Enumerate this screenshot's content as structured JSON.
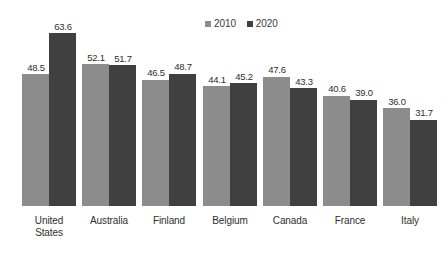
{
  "chart_data": {
    "type": "bar",
    "title": "",
    "subtitle": "",
    "xlabel": "",
    "ylabel": "",
    "ylim": [
      0,
      63.6
    ],
    "grid": false,
    "legend_position": "top-center-right",
    "categories": [
      "United States",
      "Australia",
      "Finland",
      "Belgium",
      "Canada",
      "France",
      "Italy"
    ],
    "category_lines": [
      [
        "United",
        "States"
      ],
      [
        "Australia"
      ],
      [
        "Finland"
      ],
      [
        "Belgium"
      ],
      [
        "Canada"
      ],
      [
        "France"
      ],
      [
        "Italy"
      ]
    ],
    "series": [
      {
        "name": "2010",
        "color": "#8c8c8c",
        "values": [
          48.5,
          52.1,
          46.5,
          44.1,
          47.6,
          40.6,
          36.0
        ],
        "labels": [
          "48.5",
          "52.1",
          "46.5",
          "44.1",
          "47.6",
          "40.6",
          "36.0"
        ]
      },
      {
        "name": "2020",
        "color": "#404040",
        "values": [
          63.6,
          51.7,
          48.7,
          45.2,
          43.3,
          39.0,
          31.7
        ],
        "labels": [
          "63.6",
          "51.7",
          "48.7",
          "45.2",
          "43.3",
          "39.0",
          "31.7"
        ]
      }
    ],
    "legend": [
      {
        "label": "2010",
        "color": "#8c8c8c"
      },
      {
        "label": "2020",
        "color": "#404040"
      }
    ]
  },
  "render": {
    "background_color": "#ffffff",
    "label_color": "#2e2e2e",
    "baseline_y": 206,
    "pixels_per_unit": 2.72,
    "group_left_positions": [
      22,
      82,
      142,
      203,
      263,
      323,
      383
    ]
  }
}
